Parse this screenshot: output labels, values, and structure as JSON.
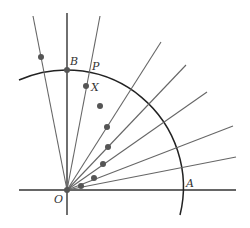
{
  "diagram": {
    "labels": {
      "origin": "O",
      "a": "A",
      "b": "B",
      "p": "P",
      "x": "X"
    },
    "colors": {
      "axis": "#333333",
      "ray": "#666666",
      "arc": "#222222",
      "dot": "#555555"
    },
    "origin": [
      67,
      190
    ],
    "arc_radius": 117,
    "rays": [
      {
        "end": [
          33,
          16
        ]
      },
      {
        "end": [
          100,
          16
        ]
      },
      {
        "end": [
          161,
          42
        ]
      },
      {
        "end": [
          186,
          65
        ]
      },
      {
        "end": [
          207,
          92
        ]
      },
      {
        "end": [
          233,
          126
        ]
      },
      {
        "end": [
          236,
          157
        ]
      }
    ],
    "dots": [
      [
        41,
        57
      ],
      [
        67,
        70
      ],
      [
        86,
        86
      ],
      [
        100,
        106
      ],
      [
        107,
        127
      ],
      [
        108,
        147
      ],
      [
        103,
        164
      ],
      [
        94,
        178
      ],
      [
        81,
        186
      ]
    ]
  }
}
